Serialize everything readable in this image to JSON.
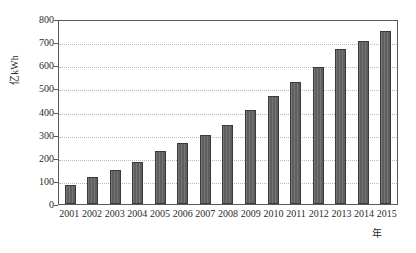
{
  "chart_data": {
    "type": "bar",
    "title": "",
    "subtitle": "",
    "xlabel": "年",
    "ylabel": "亿kWh",
    "categories": [
      "2001",
      "2002",
      "2003",
      "2004",
      "2005",
      "2006",
      "2007",
      "2008",
      "2009",
      "2010",
      "2011",
      "2012",
      "2013",
      "2014",
      "2015"
    ],
    "values": [
      82,
      115,
      145,
      180,
      228,
      262,
      298,
      340,
      407,
      467,
      527,
      592,
      672,
      703,
      747
    ],
    "ylim": [
      0,
      800
    ],
    "y_ticks": [
      0,
      100,
      200,
      300,
      400,
      500,
      600,
      700,
      800
    ],
    "y_tick_labels": [
      "0",
      "100",
      "200",
      "300",
      "400",
      "500",
      "600",
      "700",
      "800"
    ],
    "grid": true,
    "grid_axis": "y",
    "legend": false,
    "legend_position": "none",
    "bar_color": "#5f5f5f",
    "bar_edge_color": "#3a3a3a",
    "grid_color": "#b9b9b9",
    "axis_color": "#5a5a5a",
    "background_color": "#ffffff"
  }
}
